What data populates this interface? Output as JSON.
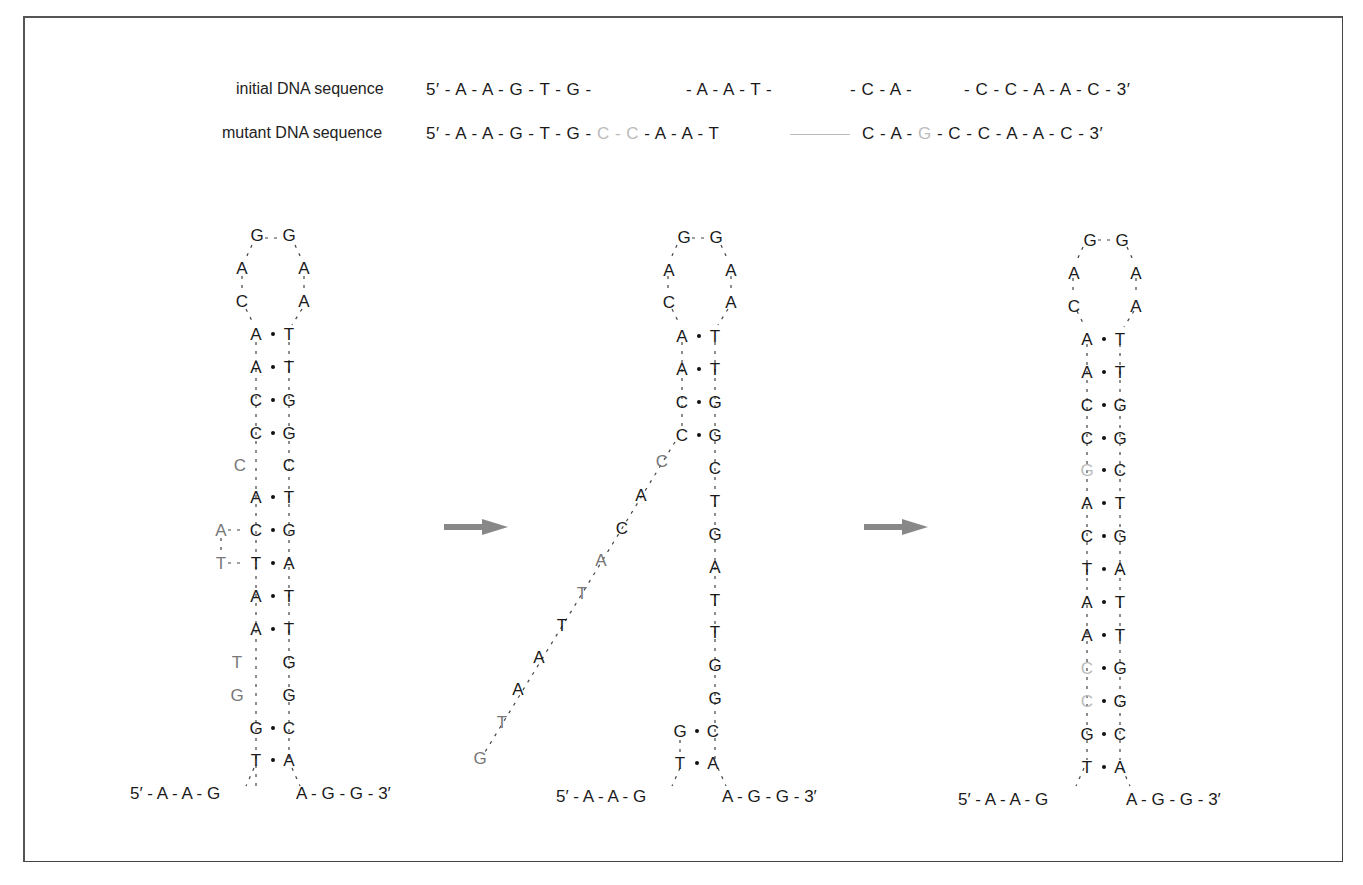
{
  "figure": {
    "sequences": {
      "initial": {
        "label": "initial DNA sequence",
        "part1": "5′ - A - A - G - T - G -",
        "part2": "- A - A - T -",
        "part3": "- C - A -",
        "part4": "- C - C - A - A - C - 3′"
      },
      "mutant": {
        "label": "mutant DNA sequence",
        "part1": "5′ - A - A - G - T - G -",
        "ins1": "C - C",
        "part2": "- A - A - T",
        "part3": "C - A -",
        "ins2": "G",
        "part4": "- C - C - A - A - C - 3′"
      }
    },
    "hairpins": [
      {
        "name": "initial-hairpin",
        "loop": [
          "G",
          "G",
          "A",
          "A",
          "C",
          "A"
        ],
        "five_prime_tail": "5′ - A - A - G",
        "three_prime_tail": "A - G - G - 3′",
        "left": [
          "A",
          "A",
          "C",
          "C",
          "C",
          "A",
          "C",
          "T",
          "A",
          "A",
          "T",
          "G",
          "G",
          "T"
        ],
        "right": [
          "T",
          "T",
          "G",
          "G",
          "C",
          "T",
          "G",
          "A",
          "T",
          "T",
          "G",
          "G",
          "C",
          "A"
        ],
        "bulge_left": [
          "A",
          "T"
        ]
      },
      {
        "name": "intermediate-hairpin",
        "loop": [
          "G",
          "G",
          "A",
          "A",
          "C",
          "A"
        ],
        "five_prime_tail": "5′ - A - A - G",
        "three_prime_tail": "A - G - G - 3′",
        "left": [
          "A",
          "A",
          "C",
          "C",
          "G",
          "T"
        ],
        "right": [
          "T",
          "T",
          "G",
          "G",
          "C",
          "T",
          "G",
          "A",
          "T",
          "T",
          "G",
          "G",
          "C",
          "A"
        ],
        "single_strand": [
          "C",
          "A",
          "C",
          "A",
          "T",
          "T",
          "A",
          "A",
          "T",
          "G"
        ]
      },
      {
        "name": "mutant-hairpin",
        "loop": [
          "G",
          "G",
          "A",
          "A",
          "C",
          "A"
        ],
        "five_prime_tail": "5′ - A - A - G",
        "three_prime_tail": "A - G - G - 3′",
        "left": [
          "A",
          "A",
          "C",
          "C",
          "G",
          "A",
          "C",
          "T",
          "A",
          "A",
          "C",
          "C",
          "G",
          "T"
        ],
        "right": [
          "T",
          "T",
          "G",
          "G",
          "C",
          "T",
          "G",
          "A",
          "T",
          "T",
          "G",
          "G",
          "C",
          "A"
        ]
      }
    ],
    "arrows": [
      "arrow-1",
      "arrow-2"
    ],
    "colors": {
      "normal": "#1a1a1a",
      "inserted": "#777777",
      "mutated": "#bbbbbb",
      "arrow": "#888888"
    }
  }
}
